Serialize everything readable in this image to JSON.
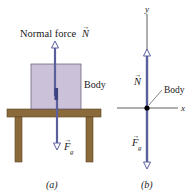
{
  "panel_a": {
    "normal_force_label": "Normal force",
    "normal_vector_symbol": "N",
    "body_label": "Body",
    "gravity_vector_symbol": "F",
    "gravity_subscript": "g",
    "caption": "(a)"
  },
  "panel_b": {
    "y_axis_label": "y",
    "x_axis_label": "x",
    "normal_vector_symbol": "N",
    "body_label": "Body",
    "gravity_vector_symbol": "F",
    "gravity_subscript": "g",
    "caption": "(b)"
  },
  "colors": {
    "vector": "#5b5f9e",
    "box_fill": "#cbc1d9",
    "box_stroke": "#5e5670",
    "table": "#8a6a3b",
    "table_stroke": "#5a4322",
    "axis": "#333333"
  }
}
